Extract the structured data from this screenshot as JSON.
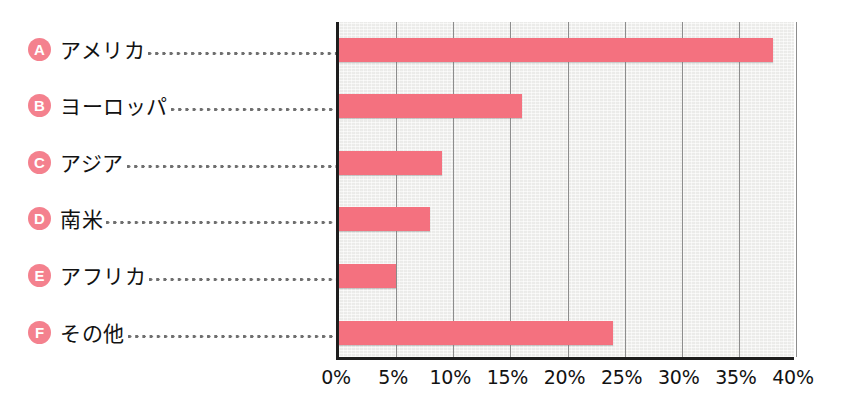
{
  "chart_data": {
    "type": "bar",
    "orientation": "horizontal",
    "title": "",
    "xlabel": "",
    "ylabel": "",
    "xlim": [
      0,
      40
    ],
    "xunit": "%",
    "grid": true,
    "legend_position": "left-labels",
    "categories": [
      "アメリカ",
      "ヨーロッパ",
      "アジア",
      "南米",
      "アフリカ",
      "その他"
    ],
    "markers": [
      "A",
      "B",
      "C",
      "D",
      "E",
      "F"
    ],
    "values": [
      38,
      16,
      9,
      8,
      5,
      24
    ],
    "xticks": [
      0,
      5,
      10,
      15,
      20,
      25,
      30,
      35,
      40
    ],
    "xtick_labels": [
      "0%",
      "5%",
      "10%",
      "15%",
      "20%",
      "25%",
      "30%",
      "35%",
      "40%"
    ],
    "series": [
      {
        "name": "share",
        "values": [
          38,
          16,
          9,
          8,
          5,
          24
        ]
      }
    ],
    "items": [
      {
        "marker": "A",
        "label": "アメリカ",
        "value": 38
      },
      {
        "marker": "B",
        "label": "ヨーロッパ",
        "value": 16
      },
      {
        "marker": "C",
        "label": "アジア",
        "value": 9
      },
      {
        "marker": "D",
        "label": "南米",
        "value": 8
      },
      {
        "marker": "E",
        "label": "アフリカ",
        "value": 5
      },
      {
        "marker": "F",
        "label": "その他",
        "value": 24
      }
    ]
  },
  "colors": {
    "bar": "#f4717f",
    "badge": "#f4818e",
    "badge_text": "#ffffff",
    "plot_background": "#f1f1ef",
    "gridline": "#8d8d8d",
    "axis": "#1d1d1d",
    "text": "#121212",
    "leader_dots": "#6e6e6e",
    "page_background": "#ffffff"
  }
}
